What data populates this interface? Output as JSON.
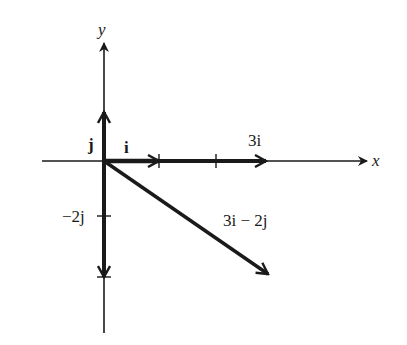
{
  "diagram": {
    "type": "vector-diagram",
    "axes": {
      "x_label": "x",
      "y_label": "y"
    },
    "vectors": [
      {
        "name": "i",
        "label": "i",
        "components": [
          1,
          0
        ]
      },
      {
        "name": "j",
        "label": "j",
        "components": [
          0,
          1
        ]
      },
      {
        "name": "3i",
        "label": "3i",
        "components": [
          3,
          0
        ]
      },
      {
        "name": "-2j",
        "label": "−2j",
        "components": [
          0,
          -2
        ]
      },
      {
        "name": "3i-2j",
        "label": "3i − 2j",
        "components": [
          3,
          -2
        ]
      }
    ],
    "colors": {
      "ink": "#1a1a1a",
      "background": "#ffffff"
    }
  }
}
